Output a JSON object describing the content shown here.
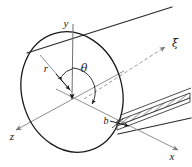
{
  "figure": {
    "name": "tilted-circular-section-coordinate-diagram",
    "background_color": "#ffffff",
    "width": 192,
    "height": 167
  },
  "colors": {
    "outline": "#1a1a1a",
    "axis": "#8c8c8c",
    "dashed_axis": "#9a9a9a",
    "hatch": "#555555",
    "label": "#1a1a1a"
  },
  "labels": {
    "y_axis": "y",
    "x_axis": "x",
    "z_axis": "z",
    "xi_axis": "ξ",
    "radius": "r",
    "angle": "θ",
    "width_b": "b"
  },
  "geometry": {
    "circle": {
      "center_x": 72,
      "center_y": 92,
      "radius_x": 52,
      "radius_y": 62,
      "rotation_deg": -18
    },
    "axes": {
      "y": {
        "x1": 74,
        "y1": 22,
        "x2": 72,
        "y2": 100,
        "arrow": "down"
      },
      "x": {
        "x1": 62,
        "y1": 97,
        "x2": 176,
        "y2": 148,
        "arrow": "end"
      },
      "z": {
        "x1": 118,
        "y1": 74,
        "x2": 14,
        "y2": 131,
        "arrow": "end"
      },
      "xi": {
        "x1": 86,
        "y1": 97,
        "x2": 168,
        "y2": 45,
        "arrow": "end",
        "dashed": true
      }
    },
    "radius_line": {
      "x1": 72,
      "y1": 92,
      "x2": 42,
      "y2": 57
    },
    "cylinder_edges": [
      {
        "x1": 28,
        "y1": 52,
        "x2": 170,
        "y2": 8
      },
      {
        "x1": 120,
        "y1": 132,
        "x2": 190,
        "y2": 117
      }
    ],
    "slot": {
      "x1": 116,
      "y1": 122,
      "x2": 190,
      "y2": 95,
      "thickness": 5,
      "hatched": true
    }
  },
  "annotations": {
    "angle_arc": {
      "from_deg": 90,
      "to_deg": 20,
      "radius": 22
    },
    "b_arrow": {
      "from_x": 112,
      "from_y": 122,
      "to_x": 128,
      "to_y": 124
    }
  }
}
